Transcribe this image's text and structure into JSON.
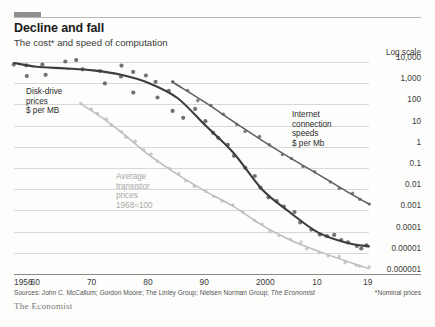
{
  "header": {
    "title": "Decline and fall",
    "subtitle": "The cost* and speed of computation",
    "tab_color": "#8f8f8f"
  },
  "chart_data": {
    "type": "line",
    "title": "Decline and fall",
    "subtitle": "The cost* and speed of computation",
    "scale_note": "Log scale",
    "xlabel": "",
    "ylabel": "",
    "grid": true,
    "legend": "inline-annotations",
    "xlim": [
      1956,
      2019
    ],
    "ylim": [
      1e-06,
      10000
    ],
    "xticks": [
      "1956",
      "60",
      "70",
      "80",
      "90",
      "2000",
      "10",
      "19"
    ],
    "xtick_values": [
      1956,
      1960,
      1970,
      1980,
      1990,
      2000,
      2010,
      2019
    ],
    "yticks": [
      "10,000",
      "1,000",
      "100",
      "10",
      "1",
      "0.1",
      "0.01",
      "0.001",
      "0.0001",
      "0.00001",
      "0.000001"
    ],
    "ytick_values": [
      10000,
      1000,
      100,
      10,
      1,
      0.1,
      0.01,
      0.001,
      0.0001,
      1e-05,
      1e-06
    ],
    "series": [
      {
        "name": "Disk-drive prices",
        "unit": "$ per MB",
        "label_lines": [
          "Disk-drive",
          "prices",
          "$ per MB"
        ],
        "color": "#3d3d3d",
        "has_points": true,
        "x": [
          1956,
          1960,
          1965,
          1970,
          1975,
          1980,
          1985,
          1990,
          1995,
          2000,
          2005,
          2010,
          2015,
          2019
        ],
        "y": [
          9000,
          6000,
          5000,
          4000,
          2500,
          1000,
          200,
          10,
          0.5,
          0.01,
          0.0008,
          9e-05,
          3e-05,
          2e-05
        ]
      },
      {
        "name": "Internet connection speeds",
        "unit": "$ per Mb",
        "label_lines": [
          "Internet",
          "connection",
          "speeds",
          "$ per Mb"
        ],
        "color": "#5e5e5e",
        "has_points": true,
        "x": [
          1984,
          1990,
          1995,
          2000,
          2005,
          2010,
          2015,
          2019
        ],
        "y": [
          1200,
          120,
          15,
          2,
          0.3,
          0.05,
          0.008,
          0.002
        ]
      },
      {
        "name": "Average transistor prices",
        "unit": "1968=100",
        "label_lines": [
          "Average",
          "transistor",
          "prices",
          "1968=100"
        ],
        "color": "#bdbdbd",
        "has_points": true,
        "x": [
          1968,
          1972,
          1976,
          1980,
          1985,
          1990,
          1995,
          2000,
          2005,
          2010,
          2015,
          2019
        ],
        "y": [
          100,
          20,
          3,
          0.4,
          0.05,
          0.008,
          0.0015,
          0.0002,
          4e-05,
          1.2e-05,
          4e-06,
          1.8e-06
        ]
      }
    ]
  },
  "footer": {
    "sources_prefix": "Sources: John C. McCallum; Gordon Moore; The Linley Group; Nielsen Norman Group;",
    "sources_italic": "The Economist",
    "nominal_note": "*Nominal prices",
    "brand": "The Economist"
  }
}
